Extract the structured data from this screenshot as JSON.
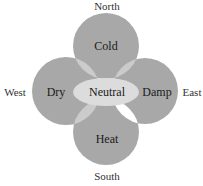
{
  "diagram": {
    "directions": {
      "north": "North",
      "south": "South",
      "east": "East",
      "west": "West"
    },
    "qualities": {
      "top": "Cold",
      "left": "Dry",
      "right": "Damp",
      "bottom": "Heat",
      "center": "Neutral"
    },
    "colors": {
      "circle": "#a8a8a8",
      "lens": "#cbcbcb",
      "center": "#dcdcdc",
      "highlight_lens": "#ffffff",
      "text": "#1a1a1a",
      "direction_text": "#333333"
    }
  }
}
